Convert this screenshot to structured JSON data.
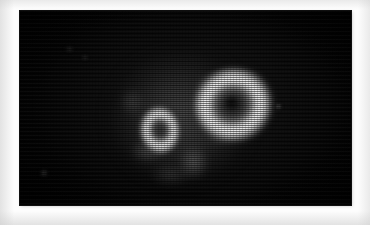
{
  "image": {
    "kind": "nuclear-medicine-scintigraphy-scan",
    "modality_hint": "planar-scintigraphy / SPECT tomographic slice",
    "canvas": {
      "background_color": "#030303",
      "frame_color": "#fdfdfd",
      "x": 20,
      "y": 11,
      "width": 331,
      "height": 194
    },
    "render": {
      "scanline_artifact": "horizontal-interlace",
      "grayscale_colormap": "black-to-white linear",
      "peak_intensity_color": "#f4f4f4",
      "mid_intensity_color": "#969696",
      "low_intensity_color": "#3a3a3a",
      "background_intensity_color": "#030303"
    },
    "regions": [
      {
        "name": "body-silhouette",
        "label": "faint circular soft-tissue outline",
        "center_x": 161,
        "center_y": 106,
        "width": 163,
        "height": 152,
        "relative_intensity": 0.22,
        "color": "#4c4c4c"
      },
      {
        "name": "lesion-large",
        "label": "large ring-shaped tracer uptake",
        "center_x": 213,
        "center_y": 96,
        "width": 86,
        "height": 80,
        "rotation_deg": -13,
        "relative_intensity": 0.96,
        "color": "#f4f4f4",
        "cavity_label": "photopenic centre",
        "cavity_intensity": 0.18,
        "focal_defect_label": "dense focal defect",
        "focal_defect_intensity": 0.03
      },
      {
        "name": "lesion-small",
        "label": "small ring-shaped tracer uptake",
        "center_x": 140,
        "center_y": 119,
        "width": 44,
        "height": 52,
        "rotation_deg": -6,
        "relative_intensity": 0.93,
        "color": "#eeeeee",
        "cavity_label": "photopenic centre",
        "cavity_intensity": 0.28
      },
      {
        "name": "hotspot-right",
        "label": "faint isolated focus, right field",
        "center_x": 278,
        "center_y": 107,
        "relative_intensity": 0.59
      },
      {
        "name": "hotspot-lower-left",
        "label": "faint isolated focus, lower-left field",
        "center_x": 44,
        "center_y": 173,
        "relative_intensity": 0.36
      },
      {
        "name": "hotspot-upper-left",
        "label": "faint background noise, upper-left field",
        "center_x": 69,
        "center_y": 49,
        "relative_intensity": 0.25
      },
      {
        "name": "hotspot-upper-mid",
        "label": "faint background noise, upper-mid field",
        "center_x": 85,
        "center_y": 57,
        "relative_intensity": 0.27
      }
    ]
  }
}
